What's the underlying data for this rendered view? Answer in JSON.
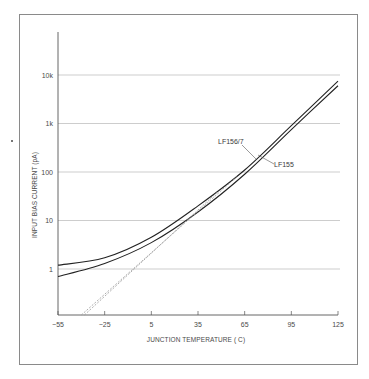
{
  "chart_data": {
    "type": "line",
    "title": "",
    "xlabel": "JUNCTION TEMPERATURE (°C)",
    "ylabel": "INPUT BIAS CURRENT (pA)",
    "xscale": "linear",
    "yscale": "log",
    "xlim": [
      -55,
      125
    ],
    "ylim": [
      0.1,
      100000
    ],
    "x_ticks": [
      -55,
      -25,
      5,
      35,
      65,
      95,
      125
    ],
    "x_tick_labels": [
      "−55",
      "−25",
      "5",
      "35",
      "65",
      "95",
      "125"
    ],
    "y_ticks": [
      1,
      10,
      100,
      1000,
      10000
    ],
    "y_tick_labels": [
      "1",
      "10",
      "100",
      "1k",
      "10k"
    ],
    "grid": "horizontal",
    "legend": "inline labels with leader lines",
    "x": [
      -55,
      -25,
      5,
      35,
      65,
      95,
      125
    ],
    "series": [
      {
        "name": "LF156/7",
        "values": [
          1.2,
          1.7,
          4.5,
          20,
          110,
          900,
          7500
        ],
        "style": "solid",
        "color": "#222222"
      },
      {
        "name": "LF155",
        "values": [
          0.7,
          1.3,
          3.5,
          15,
          90,
          750,
          6000
        ],
        "style": "solid",
        "color": "#222222"
      },
      {
        "name": "LF156/7 asymptote",
        "x": [
          -40,
          60
        ],
        "values": [
          0.1,
          80
        ],
        "style": "dashed",
        "color": "#9a9a9a"
      },
      {
        "name": "LF155 asymptote",
        "x": [
          -38,
          48
        ],
        "values": [
          0.1,
          40
        ],
        "style": "dashed",
        "color": "#9a9a9a"
      }
    ],
    "annotations": [
      {
        "text": "LF156/7",
        "points_to": "LF156/7"
      },
      {
        "text": "LF155",
        "points_to": "LF155"
      }
    ]
  },
  "labels": {
    "series_a": "LF156/7",
    "series_b": "LF155",
    "xlabel": "JUNCTION TEMPERATURE ( C)",
    "ylabel": "INPUT BIAS CURRENT (pA)"
  }
}
